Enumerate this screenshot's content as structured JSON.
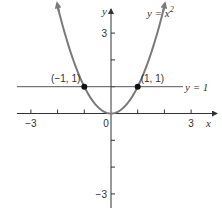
{
  "chart_data": {
    "type": "line",
    "title": "",
    "xlabel": "x",
    "ylabel": "y",
    "xlim": [
      -3.6,
      3.6
    ],
    "ylim": [
      -3.5,
      3.8
    ],
    "x_ticks": [
      -3,
      -2,
      -1,
      0,
      1,
      2,
      3
    ],
    "x_tick_labels": [
      "-3",
      "0",
      "3"
    ],
    "x_tick_label_values": [
      -3,
      0,
      3
    ],
    "y_ticks": [
      -3,
      -2,
      -1,
      1,
      2,
      3
    ],
    "y_tick_labels": [
      "3",
      "-3"
    ],
    "y_tick_label_values": [
      3,
      -3
    ],
    "grid": false,
    "series": [
      {
        "name": "y = x^2",
        "type": "curve",
        "function": "x^2",
        "x_range": [
          -2.0,
          2.0
        ],
        "color": "#7a7a7a",
        "label": "y = x",
        "label_sup": "2"
      },
      {
        "name": "y = 1",
        "type": "horizontal-line",
        "y": 1,
        "x_range": [
          -3.6,
          3.3
        ],
        "color": "#555555",
        "label": "y = 1"
      }
    ],
    "points": [
      {
        "x": -1,
        "y": 1,
        "label": "(−1, 1)"
      },
      {
        "x": 1,
        "y": 1,
        "label": "(1, 1)"
      }
    ]
  }
}
